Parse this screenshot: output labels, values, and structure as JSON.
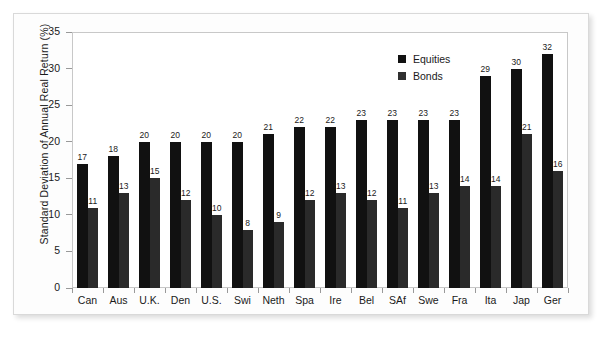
{
  "chart_data": {
    "type": "bar",
    "title": "",
    "xlabel": "",
    "ylabel": "Standard Deviation of Annual Real Return (%)",
    "ylim": [
      0,
      35
    ],
    "ytick_labels": [
      "0",
      "5",
      "10",
      "15",
      "20",
      "25",
      "30",
      "35"
    ],
    "ytick_values": [
      0,
      5,
      10,
      15,
      20,
      25,
      30,
      35
    ],
    "grid": false,
    "legend_position": "upper right",
    "categories": [
      "Can",
      "Aus",
      "U.K.",
      "Den",
      "U.S.",
      "Swi",
      "Neth",
      "Spa",
      "Ire",
      "Bel",
      "SAf",
      "Swe",
      "Fra",
      "Ita",
      "Jap",
      "Ger"
    ],
    "series": [
      {
        "name": "Equities",
        "color": "#111111",
        "values": [
          17,
          18,
          20,
          20,
          20,
          20,
          21,
          22,
          22,
          23,
          23,
          23,
          23,
          29,
          30,
          32
        ],
        "labels": [
          "17",
          "18",
          "20",
          "20",
          "20",
          "20",
          "21",
          "22",
          "22",
          "23",
          "23",
          "23",
          "23",
          "29",
          "30",
          "32"
        ]
      },
      {
        "name": "Bonds",
        "color": "#2a2a2a",
        "values": [
          11,
          13,
          15,
          12,
          10,
          8,
          9,
          12,
          13,
          12,
          11,
          13,
          14,
          14,
          21,
          16
        ],
        "labels": [
          "11",
          "13",
          "15",
          "12",
          "10",
          "8",
          "9",
          "12",
          "13",
          "12",
          "11",
          "13",
          "14",
          "14",
          "21",
          "16"
        ]
      }
    ]
  },
  "legend": {
    "items": [
      {
        "label": "Equities",
        "color": "#111111"
      },
      {
        "label": "Bonds",
        "color": "#2a2a2a"
      }
    ]
  },
  "colors": {
    "equities": "#111111",
    "bonds": "#2a2a2a",
    "frame": "#d9d9d9",
    "axis": "#c8c8c8",
    "page": "#ffffff"
  }
}
